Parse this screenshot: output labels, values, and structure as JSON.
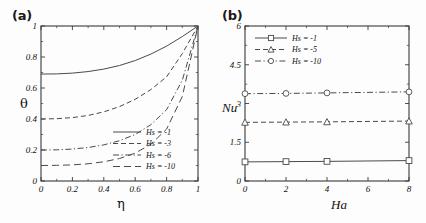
{
  "figure": {
    "background": "#fdfdfd",
    "axis_color": "#3a3a3a",
    "curve_color": "#4a4a4a"
  },
  "panels": [
    {
      "id": "a",
      "label": "(a)",
      "xlabel": "η",
      "ylabel": "θ",
      "xticks": [
        "0",
        "0.2",
        "0.4",
        "0.6",
        "0.8",
        "1"
      ],
      "xtick_values": [
        0,
        0.2,
        0.4,
        0.6,
        0.8,
        1
      ],
      "yticks": [
        "0",
        "0.2",
        "0.4",
        "0.6",
        "0.8",
        "1"
      ],
      "ytick_values": [
        0,
        0.2,
        0.4,
        0.6,
        0.8,
        1
      ],
      "legend": [
        {
          "label": "Hs = -1",
          "dash": "none"
        },
        {
          "label": "Hs = -3",
          "dash": "dashed"
        },
        {
          "label": "Hs = -6",
          "dash": "dashdot"
        },
        {
          "label": "Hs = -10",
          "dash": "longdash"
        }
      ]
    },
    {
      "id": "b",
      "label": "(b)",
      "xlabel": "Ha",
      "ylabel": "Nu",
      "ylabel_sub": "",
      "xticks": [
        "0",
        "2",
        "4",
        "6",
        "8"
      ],
      "xtick_values": [
        0,
        2,
        4,
        6,
        8
      ],
      "yticks": [
        "0",
        "1.5",
        "3",
        "4.5",
        "6"
      ],
      "ytick_values": [
        0,
        1.5,
        3,
        4.5,
        6
      ],
      "legend": [
        {
          "label": "Hs = -1",
          "marker": "square",
          "dash": "none"
        },
        {
          "label": "Hs = -5",
          "marker": "triangle",
          "dash": "dashed"
        },
        {
          "label": "Hs = -10",
          "marker": "circle",
          "dash": "dashdot"
        }
      ]
    }
  ],
  "chart_data": [
    {
      "type": "line",
      "panel": "(a)",
      "title": "",
      "xlabel": "η",
      "ylabel": "θ",
      "xlim": [
        0,
        1
      ],
      "ylim": [
        0,
        1
      ],
      "grid": false,
      "legend_position": "lower-right",
      "x": [
        0,
        0.1,
        0.2,
        0.3,
        0.4,
        0.5,
        0.6,
        0.7,
        0.8,
        0.9,
        1
      ],
      "series": [
        {
          "name": "Hs = -1",
          "dash": "none",
          "values": [
            0.69,
            0.691,
            0.696,
            0.706,
            0.722,
            0.745,
            0.777,
            0.819,
            0.87,
            0.932,
            1.0
          ]
        },
        {
          "name": "Hs = -3",
          "dash": "dashed",
          "values": [
            0.4,
            0.402,
            0.409,
            0.423,
            0.446,
            0.48,
            0.527,
            0.59,
            0.672,
            0.822,
            1.0
          ]
        },
        {
          "name": "Hs = -6",
          "dash": "dashdot",
          "values": [
            0.2,
            0.201,
            0.206,
            0.216,
            0.233,
            0.26,
            0.3,
            0.363,
            0.46,
            0.65,
            1.0
          ]
        },
        {
          "name": "Hs = -10",
          "dash": "longdash",
          "values": [
            0.1,
            0.101,
            0.104,
            0.111,
            0.124,
            0.145,
            0.18,
            0.237,
            0.335,
            0.545,
            1.0
          ]
        }
      ]
    },
    {
      "type": "line",
      "panel": "(b)",
      "title": "",
      "xlabel": "Ha",
      "ylabel": "Nu",
      "xlim": [
        0,
        8
      ],
      "ylim": [
        0,
        6
      ],
      "grid": false,
      "legend_position": "upper-left",
      "x": [
        0,
        2,
        4,
        8
      ],
      "series": [
        {
          "name": "Hs = -1",
          "marker": "square",
          "dash": "none",
          "values": [
            0.74,
            0.75,
            0.76,
            0.79
          ]
        },
        {
          "name": "Hs = -5",
          "marker": "triangle",
          "dash": "dashed",
          "values": [
            2.27,
            2.28,
            2.29,
            2.32
          ]
        },
        {
          "name": "Hs = -10",
          "marker": "circle",
          "dash": "dashdot",
          "values": [
            3.38,
            3.39,
            3.41,
            3.45
          ]
        }
      ]
    }
  ]
}
